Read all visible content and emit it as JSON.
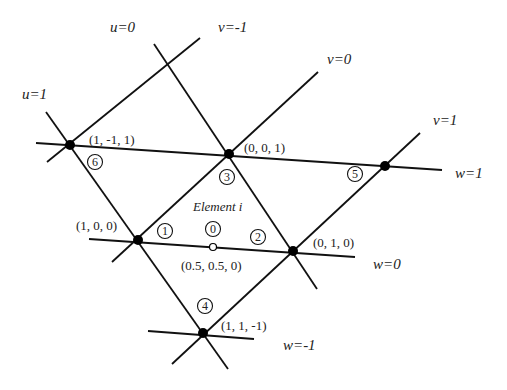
{
  "title": "Element i",
  "lines": [
    {
      "id": "u1",
      "label": "u=1",
      "x1": 46,
      "y1": 112,
      "x2": 228,
      "y2": 369,
      "label_x": 22,
      "label_y": 99
    },
    {
      "id": "u0",
      "label": "u=0",
      "x1": 154,
      "y1": 44,
      "x2": 317,
      "y2": 289,
      "label_x": 110,
      "label_y": 32
    },
    {
      "id": "vm1",
      "label": "v=-1",
      "x1": 47,
      "y1": 162,
      "x2": 200,
      "y2": 38,
      "label_x": 218,
      "label_y": 32
    },
    {
      "id": "v0",
      "label": "v=0",
      "x1": 112,
      "y1": 262,
      "x2": 318,
      "y2": 72,
      "label_x": 327,
      "label_y": 64
    },
    {
      "id": "v1",
      "label": "v=1",
      "x1": 172,
      "y1": 364,
      "x2": 420,
      "y2": 133,
      "label_x": 433,
      "label_y": 125
    },
    {
      "id": "w1",
      "label": "w=1",
      "x1": 36,
      "y1": 143,
      "x2": 442,
      "y2": 170,
      "label_x": 455,
      "label_y": 178
    },
    {
      "id": "w0",
      "label": "w=0",
      "x1": 89,
      "y1": 239,
      "x2": 355,
      "y2": 257,
      "label_x": 373,
      "label_y": 269
    },
    {
      "id": "wm1",
      "label": "w=-1",
      "x1": 148,
      "y1": 331,
      "x2": 254,
      "y2": 339,
      "label_x": 283,
      "label_y": 350
    }
  ],
  "nodes": [
    {
      "id": "n6",
      "x": 70,
      "y": 145,
      "coord": "(1, -1, 1)",
      "coord_x": 89,
      "coord_y": 144,
      "num": "6",
      "num_x": 95,
      "num_y": 162
    },
    {
      "id": "n3",
      "x": 229,
      "y": 154,
      "coord": "(0, 0, 1)",
      "coord_x": 244,
      "coord_y": 152,
      "num": "3",
      "num_x": 227,
      "num_y": 177
    },
    {
      "id": "n5",
      "x": 385,
      "y": 166,
      "coord": "",
      "coord_x": 0,
      "coord_y": 0,
      "num": "5",
      "num_x": 355,
      "num_y": 174
    },
    {
      "id": "n1",
      "x": 138,
      "y": 240,
      "coord": "(1, 0, 0)",
      "coord_x": 76,
      "coord_y": 230,
      "num": "1",
      "num_x": 165,
      "num_y": 231
    },
    {
      "id": "n2",
      "x": 293,
      "y": 251,
      "coord": "(0, 1, 0)",
      "coord_x": 313,
      "coord_y": 247,
      "num": "2",
      "num_x": 258,
      "num_y": 237
    },
    {
      "id": "n4",
      "x": 203,
      "y": 333,
      "coord": "(1, 1, -1)",
      "coord_x": 221,
      "coord_y": 330,
      "num": "4",
      "num_x": 205,
      "num_y": 306
    }
  ],
  "midpoint": {
    "x": 213,
    "y": 247,
    "coord": "(0.5, 0.5, 0)",
    "coord_x": 181,
    "coord_y": 270,
    "num": "0",
    "num_x": 213,
    "num_y": 229
  },
  "element_label": {
    "text": "Element i",
    "x": 193,
    "y": 211
  },
  "colors": {
    "line": "#111111",
    "node": "#000000",
    "background": "#ffffff"
  }
}
